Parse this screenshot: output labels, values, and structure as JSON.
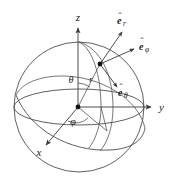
{
  "figure": {
    "background_color": "#ffffff",
    "line_color": "#4d4d4d",
    "label_color": "#1a1a1a",
    "width": 178,
    "height": 185
  },
  "axes": {
    "z": {
      "label": "z",
      "x": 78,
      "y": 21,
      "direction": "up"
    },
    "y": {
      "label": "y",
      "x": 161,
      "y": 111,
      "direction": "right"
    },
    "x": {
      "label": "x",
      "x": 39,
      "y": 156,
      "direction": "lower-left"
    }
  },
  "angles": {
    "theta": {
      "label": "θ",
      "x": 72,
      "y": 82
    },
    "phi": {
      "label": "φ",
      "x": 73,
      "y": 124
    }
  },
  "radius": {
    "label": "r",
    "x": 91,
    "y": 81
  },
  "unit_vectors": [
    {
      "name": "e-r",
      "base": "e",
      "subscript": "r",
      "hat": "ˆ",
      "label_x": 124,
      "label_y": 24
    },
    {
      "name": "e-phi",
      "base": "e",
      "subscript": "φ",
      "hat": "ˆ",
      "label_x": 143,
      "label_y": 50
    },
    {
      "name": "e-theta",
      "base": "e",
      "subscript": "θ",
      "hat": "ˆ",
      "label_x": 122,
      "label_y": 96
    }
  ],
  "points": {
    "origin": {
      "x": 78,
      "y": 108
    },
    "p": {
      "x": 100,
      "y": 64
    },
    "equator_projection": {
      "x": 107,
      "y": 131
    }
  },
  "sphere": {
    "center_x": 79,
    "center_y": 107,
    "radius": 65
  }
}
